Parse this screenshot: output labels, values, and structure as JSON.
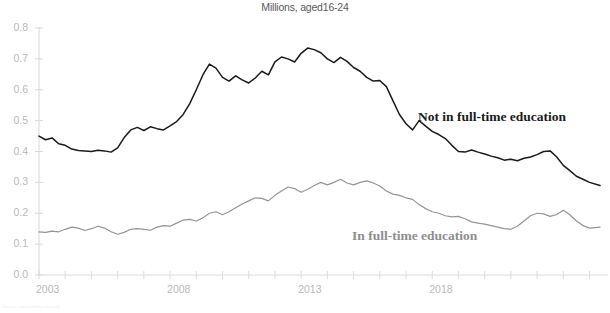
{
  "chart_data": {
    "type": "line",
    "title": "Millions, aged16-24",
    "xlabel": "",
    "ylabel": "",
    "xlim": [
      2003.0,
      2024.4
    ],
    "ylim": [
      0.0,
      0.8
    ],
    "grid": false,
    "legend_position": "inline-annotation",
    "y_ticks": [
      "0.0",
      "0.1",
      "0.2",
      "0.3",
      "0.4",
      "0.5",
      "0.6",
      "0.7",
      "0.8"
    ],
    "y_tick_values": [
      0.0,
      0.1,
      0.2,
      0.3,
      0.4,
      0.5,
      0.6,
      0.7,
      0.8
    ],
    "x_ticks": [
      "2003",
      "2008",
      "2013",
      "2018"
    ],
    "x_tick_values": [
      2003,
      2008,
      2013,
      2018
    ],
    "series": [
      {
        "name": "Not in full-time education",
        "color": "#1a1a1a",
        "label_color": "#1a1a1a",
        "x": [
          2003.0,
          2003.25,
          2003.5,
          2003.75,
          2004.0,
          2004.25,
          2004.5,
          2004.75,
          2005.0,
          2005.25,
          2005.5,
          2005.75,
          2006.0,
          2006.25,
          2006.5,
          2006.75,
          2007.0,
          2007.25,
          2007.5,
          2007.75,
          2008.0,
          2008.25,
          2008.5,
          2008.75,
          2009.0,
          2009.25,
          2009.5,
          2009.75,
          2010.0,
          2010.25,
          2010.5,
          2010.75,
          2011.0,
          2011.25,
          2011.5,
          2011.75,
          2012.0,
          2012.25,
          2012.5,
          2012.75,
          2013.0,
          2013.25,
          2013.5,
          2013.75,
          2014.0,
          2014.25,
          2014.5,
          2014.75,
          2015.0,
          2015.25,
          2015.5,
          2015.75,
          2016.0,
          2016.25,
          2016.5,
          2016.75,
          2017.0,
          2017.25,
          2017.5,
          2017.75,
          2018.0,
          2018.25,
          2018.5,
          2018.75,
          2019.0,
          2019.25,
          2019.5,
          2019.75,
          2020.0,
          2020.25,
          2020.5,
          2020.75,
          2021.0,
          2021.25,
          2021.5,
          2021.75,
          2022.0,
          2022.25,
          2022.5,
          2022.75,
          2023.0,
          2023.25,
          2023.5,
          2023.75,
          2024.0,
          2024.4
        ],
        "y": [
          0.45,
          0.438,
          0.444,
          0.425,
          0.42,
          0.408,
          0.403,
          0.402,
          0.4,
          0.404,
          0.402,
          0.398,
          0.412,
          0.445,
          0.47,
          0.478,
          0.468,
          0.48,
          0.474,
          0.47,
          0.483,
          0.497,
          0.52,
          0.555,
          0.6,
          0.648,
          0.683,
          0.67,
          0.64,
          0.628,
          0.645,
          0.632,
          0.622,
          0.638,
          0.66,
          0.648,
          0.69,
          0.706,
          0.7,
          0.69,
          0.718,
          0.735,
          0.73,
          0.72,
          0.7,
          0.688,
          0.705,
          0.692,
          0.672,
          0.66,
          0.64,
          0.628,
          0.63,
          0.61,
          0.565,
          0.52,
          0.49,
          0.47,
          0.5,
          0.482,
          0.465,
          0.455,
          0.442,
          0.42,
          0.4,
          0.398,
          0.405,
          0.398,
          0.392,
          0.385,
          0.38,
          0.372,
          0.375,
          0.37,
          0.378,
          0.382,
          0.39,
          0.4,
          0.402,
          0.382,
          0.355,
          0.338,
          0.32,
          0.31,
          0.3,
          0.29
        ]
      },
      {
        "name": "In full-time education",
        "color": "#949494",
        "label_color": "#8e8e8e",
        "x": [
          2003.0,
          2003.25,
          2003.5,
          2003.75,
          2004.0,
          2004.25,
          2004.5,
          2004.75,
          2005.0,
          2005.25,
          2005.5,
          2005.75,
          2006.0,
          2006.25,
          2006.5,
          2006.75,
          2007.0,
          2007.25,
          2007.5,
          2007.75,
          2008.0,
          2008.25,
          2008.5,
          2008.75,
          2009.0,
          2009.25,
          2009.5,
          2009.75,
          2010.0,
          2010.25,
          2010.5,
          2010.75,
          2011.0,
          2011.25,
          2011.5,
          2011.75,
          2012.0,
          2012.25,
          2012.5,
          2012.75,
          2013.0,
          2013.25,
          2013.5,
          2013.75,
          2014.0,
          2014.25,
          2014.5,
          2014.75,
          2015.0,
          2015.25,
          2015.5,
          2015.75,
          2016.0,
          2016.25,
          2016.5,
          2016.75,
          2017.0,
          2017.25,
          2017.5,
          2017.75,
          2018.0,
          2018.25,
          2018.5,
          2018.75,
          2019.0,
          2019.25,
          2019.5,
          2019.75,
          2020.0,
          2020.25,
          2020.5,
          2020.75,
          2021.0,
          2021.25,
          2021.5,
          2021.75,
          2022.0,
          2022.25,
          2022.5,
          2022.75,
          2023.0,
          2023.25,
          2023.5,
          2023.75,
          2024.0,
          2024.4
        ],
        "y": [
          0.14,
          0.138,
          0.142,
          0.14,
          0.148,
          0.155,
          0.152,
          0.144,
          0.15,
          0.158,
          0.152,
          0.14,
          0.132,
          0.138,
          0.148,
          0.15,
          0.148,
          0.145,
          0.155,
          0.16,
          0.158,
          0.168,
          0.178,
          0.18,
          0.175,
          0.185,
          0.2,
          0.205,
          0.195,
          0.205,
          0.218,
          0.23,
          0.24,
          0.25,
          0.248,
          0.24,
          0.258,
          0.272,
          0.285,
          0.28,
          0.268,
          0.278,
          0.29,
          0.3,
          0.292,
          0.3,
          0.31,
          0.298,
          0.292,
          0.3,
          0.305,
          0.298,
          0.288,
          0.272,
          0.262,
          0.258,
          0.25,
          0.245,
          0.228,
          0.215,
          0.205,
          0.2,
          0.192,
          0.188,
          0.19,
          0.182,
          0.172,
          0.168,
          0.165,
          0.16,
          0.155,
          0.15,
          0.148,
          0.158,
          0.175,
          0.192,
          0.2,
          0.198,
          0.19,
          0.196,
          0.21,
          0.195,
          0.175,
          0.16,
          0.152,
          0.155
        ]
      }
    ]
  },
  "footnote": {
    "text": "Source: Labour Force Survey"
  }
}
